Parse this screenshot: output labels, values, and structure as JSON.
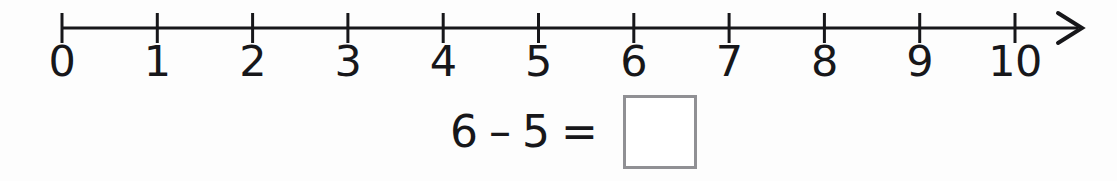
{
  "worksheet": {
    "background_color": "#fdfdfd",
    "ink_color": "#17171a"
  },
  "number_line": {
    "name": "number-line",
    "start_value": 0,
    "end_value": 10,
    "tick_labels": [
      "0",
      "1",
      "2",
      "3",
      "4",
      "5",
      "6",
      "7",
      "8",
      "9",
      "10"
    ],
    "tick_values": [
      0,
      1,
      2,
      3,
      4,
      5,
      6,
      7,
      8,
      9,
      10
    ],
    "has_arrow_right": true,
    "has_arrow_left": false,
    "axis_color": "#17171a",
    "origin_x": 62,
    "tick_spacing": 95.3,
    "axis_y": 28,
    "tick_top": 13,
    "tick_bottom": 43,
    "arrow_tip_x": 1082
  },
  "equation": {
    "name": "subtraction-equation",
    "left_operand": "6",
    "operator": "–",
    "right_operand": "5",
    "equals": "=",
    "answer_value": "",
    "answer_box_border_color": "#909094"
  }
}
